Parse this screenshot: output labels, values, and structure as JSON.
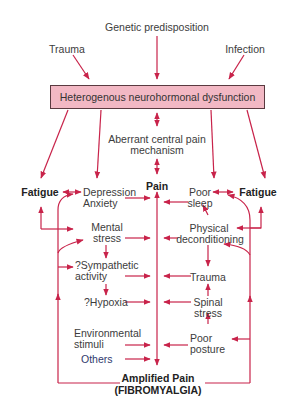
{
  "diagram": {
    "colors": {
      "arrow": "#c8234a",
      "box_fill": "#f2b8c4",
      "box_border": "#5a3a40",
      "text": "#3c3c3c"
    },
    "top_causes": {
      "genetic": "Genetic predisposition",
      "trauma": "Trauma",
      "infection": "Infection"
    },
    "central_box": "Heterogenous neurohormonal dysfunction",
    "center": {
      "aberrant_line1": "Aberrant central pain",
      "aberrant_line2": "mechanism",
      "pain": "Pain"
    },
    "left_column": {
      "fatigue": "Fatigue",
      "depression": "Depression",
      "anxiety": "Anxiety",
      "mental": "Mental",
      "stress": "stress",
      "sympathetic": "?Sympathetic",
      "activity": "activity",
      "hypoxia": "?Hypoxia",
      "environmental": "Environmental",
      "stimuli": "stimuli",
      "others": "Others"
    },
    "right_column": {
      "fatigue": "Fatigue",
      "poor_sleep_1": "Poor",
      "poor_sleep_2": "sleep",
      "physical_1": "Physical",
      "physical_2": "deconditioning",
      "trauma": "Trauma",
      "spinal_1": "Spinal",
      "spinal_2": "stress",
      "poor_posture_1": "Poor",
      "poor_posture_2": "posture"
    },
    "outcome": {
      "line1": "Amplified Pain",
      "line2": "(FIBROMYALGIA)"
    }
  }
}
